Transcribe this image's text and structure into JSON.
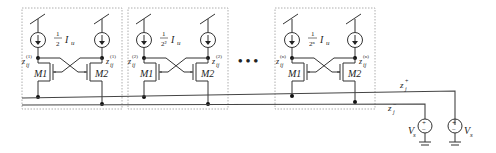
{
  "diagram": {
    "title": "",
    "cells": [
      {
        "index": "1",
        "current_label": "I_u",
        "current_fraction_num": "1",
        "current_fraction_den": "2",
        "left_node": "z_ij^(1)",
        "right_node": "z_ij^(1)",
        "m1": "M1",
        "m2": "M2"
      },
      {
        "index": "2",
        "current_label": "I_u",
        "current_fraction_num": "1",
        "current_fraction_den": "2²",
        "left_node": "z_ij^(2)",
        "right_node": "z_ij^(2)",
        "m1": "M1",
        "m2": "M2"
      },
      {
        "index": "n",
        "current_label": "I_u",
        "current_fraction_num": "1",
        "current_fraction_den": "2ⁿ",
        "left_node": "z_ij^(n)",
        "right_node": "z_ij^(n)",
        "m1": "M1",
        "m2": "M2"
      }
    ],
    "ellipsis": "•••",
    "buses": {
      "plus": {
        "label": "z",
        "sub": "j",
        "sup": "+"
      },
      "minus": {
        "label": "z",
        "sub": "j",
        "sup": "−"
      }
    },
    "sources": [
      {
        "label": "V",
        "sub": "s",
        "plus": "+",
        "minus": "−"
      },
      {
        "label": "V",
        "sub": "s",
        "plus": "+",
        "minus": "−"
      }
    ]
  },
  "labels": {
    "cell1_m1": "M1",
    "cell1_m2": "M2",
    "cell2_m1": "M1",
    "cell2_m2": "M2",
    "celln_m1": "M1",
    "celln_m2": "M2",
    "frac_num": "1",
    "cell1_den": "2",
    "cell2_den": "2²",
    "celln_den": "2ⁿ",
    "iu": "I",
    "iu_sub": "u",
    "z": "z",
    "ij": "ij",
    "sup1": "(1)",
    "sup2": "(2)",
    "supn": "(n)",
    "zj": "z",
    "j": "j",
    "plus": "+",
    "minus": "−",
    "vs": "V",
    "vs_sub": "s",
    "ellipsis": "• • •"
  }
}
